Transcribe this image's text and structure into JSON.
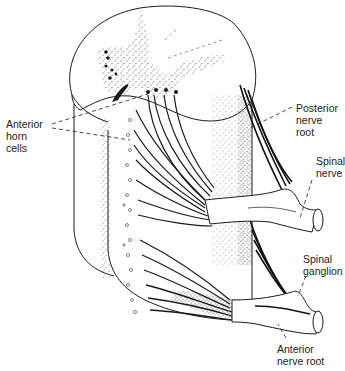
{
  "diagram": {
    "line_color": "#1a1a1a",
    "stipple_color": "#3a3a3a",
    "labels": {
      "anterior_horn_cells": "Anterior\nhorn\ncells",
      "posterior_nerve_root": "Posterior\nnerve\nroot",
      "spinal_nerve": "Spinal\nnerve",
      "spinal_ganglion": "Spinal\nganglion",
      "anterior_nerve_root": "Anterior\nnerve root"
    }
  }
}
